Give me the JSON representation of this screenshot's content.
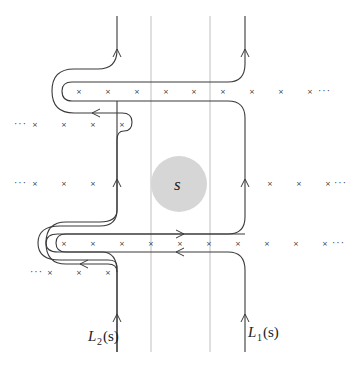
{
  "diagram": {
    "type": "contour-integration-paths",
    "center_disk": {
      "label": "s",
      "cx": 179,
      "cy": 184,
      "r": 28,
      "color": "#d6d6d6"
    },
    "guide_lines_x": [
      151,
      210
    ],
    "contours": [
      {
        "name": "L_2(s)",
        "label_main": "L",
        "label_sub": "2",
        "label_arg": "(s)",
        "x": 117
      },
      {
        "name": "L_1(s)",
        "label_main": "L",
        "label_sub": "1",
        "label_arg": "(s)",
        "x": 245
      }
    ],
    "pole_rows": [
      {
        "y": 91,
        "xs": [
          79,
          108,
          137,
          166,
          194,
          223,
          252,
          281,
          310
        ],
        "dots_left": "",
        "dots_right": "···"
      },
      {
        "y": 124,
        "xs": [
          35,
          64,
          93,
          122
        ],
        "dots_left": "···",
        "dots_right": ""
      },
      {
        "y": 183,
        "xs": [
          35,
          64,
          93,
          122,
          267,
          296,
          325
        ],
        "dots_left": "···",
        "dots_right": "···"
      },
      {
        "y": 243,
        "xs": [
          64,
          93,
          122,
          151,
          180,
          209,
          238,
          267,
          296,
          325
        ],
        "dots_left": "",
        "dots_right": "···"
      },
      {
        "y": 272,
        "xs": [
          50,
          79,
          108
        ],
        "dots_left": "···",
        "dots_right": ""
      }
    ],
    "cross_glyph": "×",
    "ellipsis": "···"
  }
}
